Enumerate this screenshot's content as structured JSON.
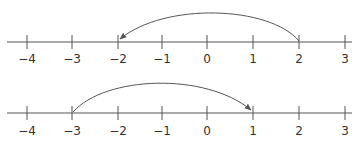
{
  "diagram": {
    "type": "number-lines",
    "colors": {
      "line": "#555555",
      "text": "#333333",
      "arrow": "#555555"
    },
    "number_lines": [
      {
        "id": "top",
        "ticks": [
          "−4",
          "−3",
          "−2",
          "−1",
          "0",
          "1",
          "2",
          "3"
        ],
        "jump": {
          "from": "2",
          "to": "−2",
          "direction": "left"
        }
      },
      {
        "id": "bottom",
        "ticks": [
          "−4",
          "−3",
          "−2",
          "−1",
          "0",
          "1",
          "2",
          "3"
        ],
        "jump": {
          "from": "−3",
          "to": "1",
          "direction": "right"
        }
      }
    ]
  }
}
